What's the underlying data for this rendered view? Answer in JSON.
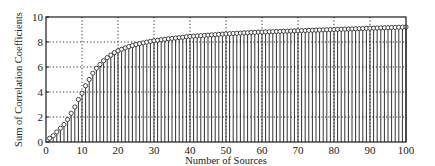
{
  "chart_data": {
    "type": "stem",
    "title": "",
    "xlabel": "Number of Sources",
    "ylabel": "Sum of Correlation Coefficients",
    "xlim": [
      0,
      100
    ],
    "ylim": [
      0,
      10
    ],
    "xticks": [
      0,
      10,
      20,
      30,
      40,
      50,
      60,
      70,
      80,
      90,
      100
    ],
    "yticks": [
      0,
      2,
      4,
      6,
      8,
      10
    ],
    "grid": true,
    "grid_style": "dotted",
    "marker": "open-circle",
    "legend": null,
    "x": [
      1,
      2,
      3,
      4,
      5,
      6,
      7,
      8,
      9,
      10,
      11,
      12,
      13,
      14,
      15,
      16,
      17,
      18,
      19,
      20,
      21,
      22,
      23,
      24,
      25,
      26,
      27,
      28,
      29,
      30,
      31,
      32,
      33,
      34,
      35,
      36,
      37,
      38,
      39,
      40,
      41,
      42,
      43,
      44,
      45,
      46,
      47,
      48,
      49,
      50,
      51,
      52,
      53,
      54,
      55,
      56,
      57,
      58,
      59,
      60,
      61,
      62,
      63,
      64,
      65,
      66,
      67,
      68,
      69,
      70,
      71,
      72,
      73,
      74,
      75,
      76,
      77,
      78,
      79,
      80,
      81,
      82,
      83,
      84,
      85,
      86,
      87,
      88,
      89,
      90,
      91,
      92,
      93,
      94,
      95,
      96,
      97,
      98,
      99,
      100
    ],
    "values": [
      0.3,
      0.5,
      0.8,
      1.1,
      1.4,
      1.8,
      2.3,
      2.8,
      3.4,
      3.9,
      4.5,
      5.0,
      5.5,
      5.9,
      6.2,
      6.5,
      6.75,
      6.95,
      7.15,
      7.3,
      7.42,
      7.53,
      7.63,
      7.72,
      7.8,
      7.87,
      7.93,
      7.99,
      8.05,
      8.1,
      8.14,
      8.18,
      8.22,
      8.26,
      8.29,
      8.32,
      8.35,
      8.38,
      8.42,
      8.45,
      8.47,
      8.49,
      8.51,
      8.53,
      8.55,
      8.57,
      8.59,
      8.61,
      8.63,
      8.65,
      8.67,
      8.68,
      8.7,
      8.71,
      8.73,
      8.74,
      8.76,
      8.77,
      8.79,
      8.8,
      8.81,
      8.82,
      8.83,
      8.84,
      8.85,
      8.86,
      8.87,
      8.88,
      8.89,
      8.9,
      8.91,
      8.92,
      8.93,
      8.94,
      8.95,
      8.96,
      8.97,
      8.98,
      8.99,
      9.0,
      9.01,
      9.02,
      9.03,
      9.04,
      9.05,
      9.06,
      9.07,
      9.08,
      9.09,
      9.1,
      9.11,
      9.12,
      9.13,
      9.14,
      9.15,
      9.16,
      9.17,
      9.18,
      9.19,
      9.2
    ]
  },
  "colors": {
    "ink": "#1a1a1a",
    "background": "#ffffff"
  }
}
